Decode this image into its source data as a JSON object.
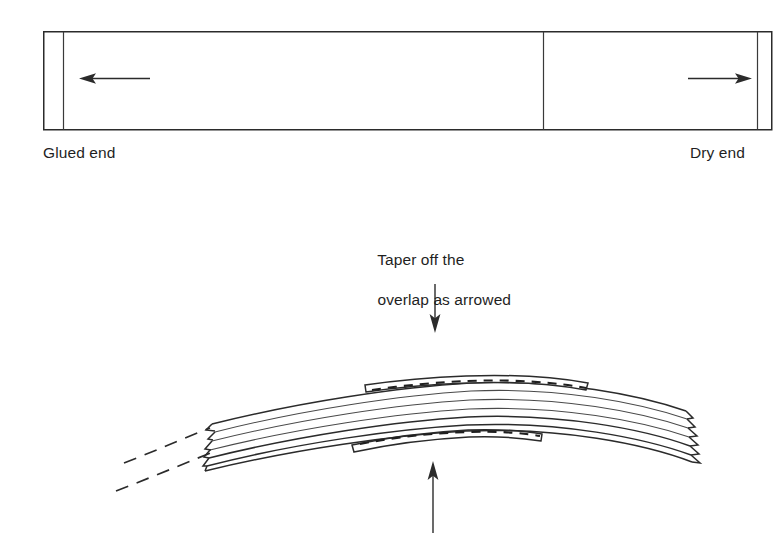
{
  "figure": {
    "title_semantic": "laminated-bow-glue-up-diagram",
    "background_color": "#ffffff",
    "line_color": "#2b2b2b",
    "text_color": "#1f1f1f"
  },
  "top_panel": {
    "name": "stave-plan-view",
    "left_label": "Glued end",
    "right_label": "Dry end",
    "left_arrow": {
      "name": "left-pointing-arrow",
      "direction": "left",
      "x_start": 150,
      "x_end": 82,
      "y": 78
    },
    "right_arrow": {
      "name": "right-pointing-arrow",
      "direction": "right",
      "x_start": 688,
      "x_end": 750,
      "y": 78
    },
    "rect": {
      "x": 43,
      "y": 31,
      "width": 729,
      "height": 99
    },
    "inner_left_line_x": 63,
    "inner_right_line_x": 757,
    "divider_line_x": 543
  },
  "annotation": {
    "name": "taper-note",
    "line1": "Taper off the",
    "line2": "overlap as arrowed",
    "down_arrow": {
      "name": "down-pointing-arrow",
      "direction": "down",
      "x": 435,
      "y_start": 283,
      "y_end": 332
    },
    "up_arrow": {
      "name": "up-pointing-arrow",
      "direction": "up",
      "x": 433,
      "y_start": 533,
      "y_end": 462
    }
  },
  "bow_diagram": {
    "name": "curved-laminated-bow",
    "lamination_count": 5,
    "has_dashed_extension_lines": true,
    "dashed_extension_count": 2,
    "overlap_strips": 2,
    "staggered_ends": [
      "left",
      "right"
    ]
  }
}
